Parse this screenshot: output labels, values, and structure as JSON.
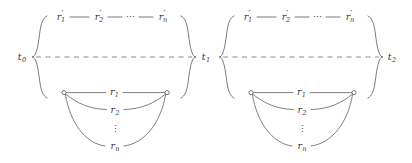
{
  "diagram": {
    "type": "time-interval-branch-diagram",
    "background_color": "#ffffff",
    "line_color": "#55555f",
    "text_color": "#3a3a44",
    "dash_color": "#6a6a74",
    "horizontal_connector": "—",
    "horizontal_ellipsis": "⋯",
    "vertical_ellipsis": "⋮",
    "time_points": [
      {
        "id": "t0",
        "base": "t",
        "sub": "0",
        "x": 22,
        "y": 57
      },
      {
        "id": "t1",
        "base": "t",
        "sub": "1",
        "x": 205,
        "y": 57
      },
      {
        "id": "t2",
        "base": "t",
        "sub": "2",
        "x": 392,
        "y": 57
      }
    ],
    "groups": [
      {
        "id": "group-left",
        "start_label": "t0",
        "end_label": "t1",
        "left_x": 32,
        "right_x": 196,
        "upper_branch": {
          "items": [
            {
              "base": "r",
              "prime": "′",
              "sub": "1"
            },
            {
              "base": "r",
              "prime": "′",
              "sub": "2"
            },
            {
              "base": "r",
              "prime": "′",
              "sub": "n"
            }
          ],
          "ellipsis_between": true
        },
        "lower_branch": {
          "items": [
            {
              "base": "r",
              "sub": "1"
            },
            {
              "base": "r",
              "sub": "2"
            },
            {
              "base": "r",
              "sub": "n"
            }
          ],
          "ellipsis_between": true,
          "node_left": {
            "x": 64,
            "y": 93
          },
          "node_right": {
            "x": 167,
            "y": 93
          }
        }
      },
      {
        "id": "group-right",
        "start_label": "t1",
        "end_label": "t2",
        "left_x": 219,
        "right_x": 383,
        "upper_branch": {
          "items": [
            {
              "base": "r",
              "prime": "′",
              "sub": "1"
            },
            {
              "base": "r",
              "prime": "′",
              "sub": "2"
            },
            {
              "base": "r",
              "prime": "′",
              "sub": "n"
            }
          ],
          "ellipsis_between": true
        },
        "lower_branch": {
          "items": [
            {
              "base": "r",
              "sub": "1"
            },
            {
              "base": "r",
              "sub": "2"
            },
            {
              "base": "r",
              "sub": "n"
            }
          ],
          "ellipsis_between": true,
          "node_left": {
            "x": 251,
            "y": 93
          },
          "node_right": {
            "x": 354,
            "y": 93
          }
        }
      }
    ]
  }
}
